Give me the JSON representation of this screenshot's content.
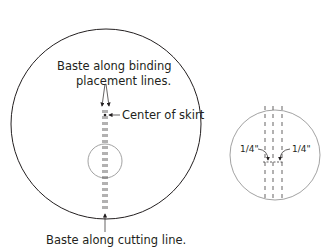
{
  "left_diagram": {
    "label_binding_line1": "Baste along binding",
    "label_binding_line2": "placement lines.",
    "label_center": "Center of skirt",
    "label_cutting": "Baste along cutting line."
  },
  "right_diagram": {
    "label_left_offset": "1/4\"",
    "label_right_offset": "1/4\""
  }
}
